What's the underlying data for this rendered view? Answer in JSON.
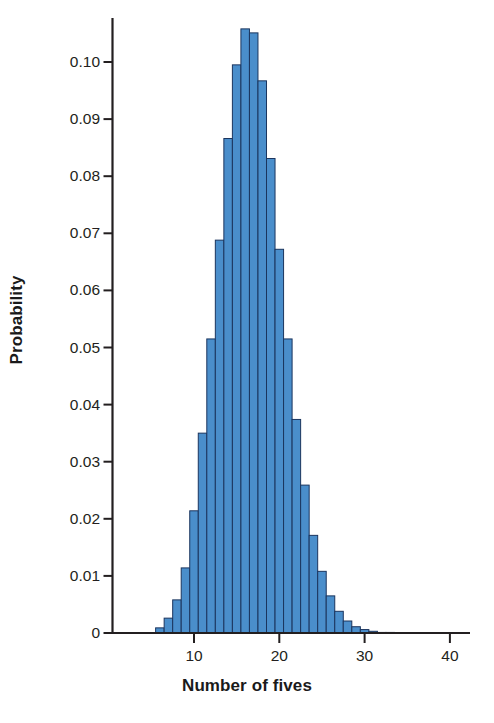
{
  "chart_data": {
    "type": "bar",
    "title": "",
    "subtitle": "",
    "xlabel": "Number of fives",
    "ylabel": "Probability",
    "xlim": [
      3.0,
      44.5
    ],
    "ylim": [
      0,
      0.1085
    ],
    "grid": false,
    "legend": null,
    "annotations": [],
    "x_ticks": [
      10,
      20,
      30,
      40
    ],
    "x_tick_labels": [
      "10",
      "20",
      "30",
      "40"
    ],
    "y_ticks": [
      0,
      0.01,
      0.02,
      0.03,
      0.04,
      0.05,
      0.06,
      0.07,
      0.08,
      0.09,
      0.1
    ],
    "y_tick_labels": [
      "0",
      "0.01",
      "0.02",
      "0.03",
      "0.04",
      "0.05",
      "0.06",
      "0.07",
      "0.08",
      "0.09",
      "0.10"
    ],
    "bar_fill_color": "#4a8ecb",
    "bar_edge_color": "#1b355e",
    "axis_color": "#231f20",
    "background_color": "#ffffff",
    "bar_width": 1,
    "categories": [
      6,
      7,
      8,
      9,
      10,
      11,
      12,
      13,
      14,
      15,
      16,
      17,
      18,
      19,
      20,
      21,
      22,
      23,
      24,
      25,
      26,
      27,
      28,
      29,
      30,
      31,
      32,
      33,
      34
    ],
    "values": [
      0.0009,
      0.0026,
      0.0058,
      0.0114,
      0.0214,
      0.035,
      0.0515,
      0.0688,
      0.0866,
      0.0995,
      0.1058,
      0.1051,
      0.0967,
      0.0831,
      0.0672,
      0.0515,
      0.0374,
      0.0259,
      0.0171,
      0.0108,
      0.0065,
      0.0038,
      0.0021,
      0.0011,
      0.0006,
      0.0003,
      0.0001,
      0.0001,
      0.0
    ]
  }
}
